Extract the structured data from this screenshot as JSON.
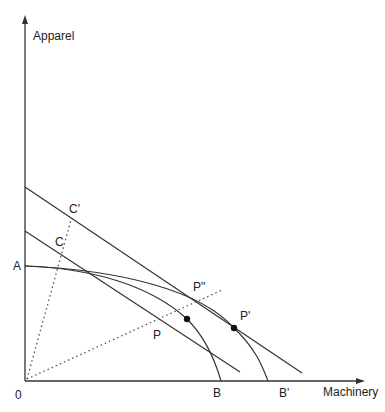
{
  "diagram": {
    "type": "production-possibility-frontier",
    "axes": {
      "y_label": "Apparel",
      "x_label": "Machinery",
      "origin_label": "0"
    },
    "points": {
      "A": "A",
      "B": "B",
      "B_prime": "B'",
      "C": "C",
      "C_prime": "C'",
      "P": "P",
      "P_prime": "P'",
      "P_double_prime": "P\""
    },
    "colors": {
      "line": "#333333",
      "background": "#ffffff"
    }
  }
}
